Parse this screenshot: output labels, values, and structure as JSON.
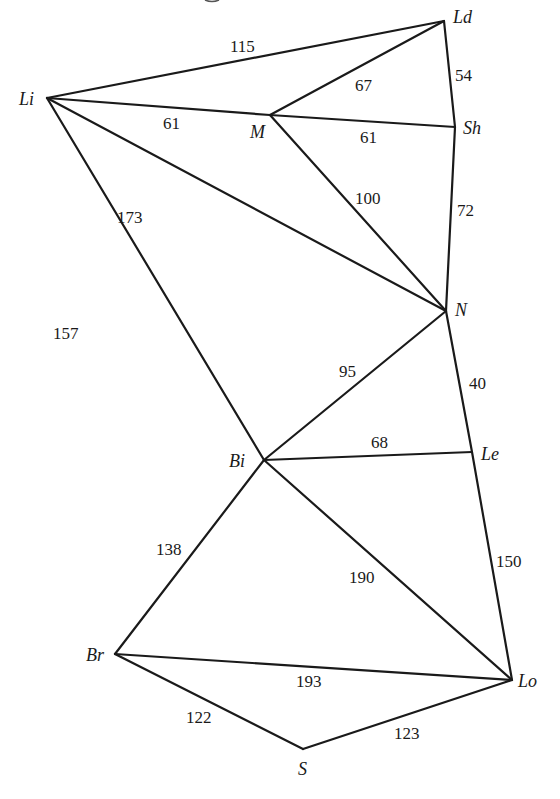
{
  "diagram": {
    "type": "weighted-undirected-graph",
    "nodes": [
      {
        "id": "Li",
        "label": "Li",
        "x": 47,
        "y": 98,
        "label_dx": -28,
        "label_dy": 7
      },
      {
        "id": "Ld",
        "label": "Ld",
        "x": 444,
        "y": 21,
        "label_dx": 9,
        "label_dy": 2
      },
      {
        "id": "M",
        "label": "M",
        "x": 270,
        "y": 115,
        "label_dx": -20,
        "label_dy": 23
      },
      {
        "id": "Sh",
        "label": "Sh",
        "x": 455,
        "y": 127,
        "label_dx": 8,
        "label_dy": 7
      },
      {
        "id": "N",
        "label": "N",
        "x": 446,
        "y": 311,
        "label_dx": 9,
        "label_dy": 5
      },
      {
        "id": "Bi",
        "label": "Bi",
        "x": 264,
        "y": 460,
        "label_dx": -35,
        "label_dy": 7
      },
      {
        "id": "Le",
        "label": "Le",
        "x": 472,
        "y": 452,
        "label_dx": 9,
        "label_dy": 8
      },
      {
        "id": "Br",
        "label": "Br",
        "x": 115,
        "y": 654,
        "label_dx": -29,
        "label_dy": 7
      },
      {
        "id": "Lo",
        "label": "Lo",
        "x": 512,
        "y": 680,
        "label_dx": 6,
        "label_dy": 7
      },
      {
        "id": "S",
        "label": "S",
        "x": 303,
        "y": 749,
        "label_dx": -5,
        "label_dy": 26
      }
    ],
    "edges": [
      {
        "from": "Li",
        "to": "Ld",
        "weight": "115",
        "lx": 230,
        "ly": 52
      },
      {
        "from": "Li",
        "to": "M",
        "weight": "61",
        "lx": 163,
        "ly": 129
      },
      {
        "from": "Li",
        "to": "N",
        "weight": "173",
        "lx": 117,
        "ly": 223
      },
      {
        "from": "Li",
        "to": "Bi",
        "weight": "157",
        "lx": 53,
        "ly": 339
      },
      {
        "from": "M",
        "to": "Ld",
        "weight": "67",
        "lx": 355,
        "ly": 91
      },
      {
        "from": "M",
        "to": "Sh",
        "weight": "61",
        "lx": 360,
        "ly": 143
      },
      {
        "from": "M",
        "to": "N",
        "weight": "100",
        "lx": 355,
        "ly": 204
      },
      {
        "from": "Ld",
        "to": "Sh",
        "weight": "54",
        "lx": 455,
        "ly": 81
      },
      {
        "from": "Sh",
        "to": "N",
        "weight": "72",
        "lx": 457,
        "ly": 216
      },
      {
        "from": "N",
        "to": "Bi",
        "weight": "95",
        "lx": 339,
        "ly": 377
      },
      {
        "from": "N",
        "to": "Le",
        "weight": "40",
        "lx": 469,
        "ly": 389
      },
      {
        "from": "Bi",
        "to": "Le",
        "weight": "68",
        "lx": 371,
        "ly": 448
      },
      {
        "from": "Bi",
        "to": "Br",
        "weight": "138",
        "lx": 156,
        "ly": 555
      },
      {
        "from": "Bi",
        "to": "Lo",
        "weight": "190",
        "lx": 349,
        "ly": 583
      },
      {
        "from": "Le",
        "to": "Lo",
        "weight": "150",
        "lx": 496,
        "ly": 567
      },
      {
        "from": "Br",
        "to": "Lo",
        "weight": "193",
        "lx": 296,
        "ly": 687
      },
      {
        "from": "Br",
        "to": "S",
        "weight": "122",
        "lx": 186,
        "ly": 723
      },
      {
        "from": "S",
        "to": "Lo",
        "weight": "123",
        "lx": 394,
        "ly": 739
      }
    ]
  }
}
